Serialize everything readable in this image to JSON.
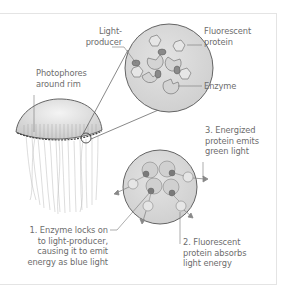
{
  "diagram": {
    "labels": {
      "light_producer_1": "Light-",
      "light_producer_2": "producer",
      "fluorescent_protein_1": "Fluorescent",
      "fluorescent_protein_2": "protein",
      "enzyme": "Enzyme",
      "photophores_1": "Photophores",
      "photophores_2": "around rim"
    },
    "steps": [
      {
        "lines": [
          "1. Enzyme locks on",
          "to light-producer,",
          "causing it to emit",
          "energy as blue light"
        ]
      },
      {
        "lines": [
          "2. Fluorescent",
          "protein absorbs",
          "light energy"
        ]
      },
      {
        "lines": [
          "3. Energized",
          "protein emits",
          "green light"
        ]
      }
    ],
    "colors": {
      "circle_fill": "#d9d9d9",
      "outline": "#555555",
      "leader_line": "#777777",
      "text": "#6d6d6d",
      "frame": "#e4e4e4"
    }
  }
}
